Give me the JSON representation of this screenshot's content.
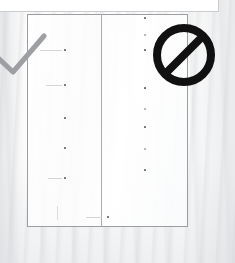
{
  "scene": {
    "title": "Garment inspection annotation",
    "background_color": "#fcfcfc",
    "fabric_texture": "vertical-streaks",
    "width": 235,
    "height": 263
  },
  "top_panel": {
    "name": "upper-white-panel",
    "fill_color": "#ffffff",
    "border_color": "#c9cbcd"
  },
  "document": {
    "name": "rectangular-placket-outline",
    "border_color": "#9b9da0",
    "fill_color": "#ffffff",
    "divider_color": "#a9abae",
    "left_panel_label": "left-panel",
    "right_panel_label": "right-panel"
  },
  "marks": {
    "left_column": [
      {
        "x": 65,
        "y": 50
      },
      {
        "x": 65,
        "y": 85
      },
      {
        "x": 65,
        "y": 118
      },
      {
        "x": 65,
        "y": 148
      },
      {
        "x": 65,
        "y": 178
      }
    ],
    "right_column": [
      {
        "x": 145,
        "y": 18
      },
      {
        "x": 145,
        "y": 50
      },
      {
        "x": 145,
        "y": 88
      },
      {
        "x": 145,
        "y": 127
      },
      {
        "x": 145,
        "y": 170
      }
    ],
    "bottom_mark": {
      "x": 108,
      "y": 217
    },
    "dot_color": "#6d6f72",
    "guide_color": "#d3d5d8"
  },
  "annotations": {
    "check": {
      "label": "checkmark",
      "meaning": "correct",
      "color": "#9d9fa2",
      "stroke_width": 5
    },
    "prohibition": {
      "label": "prohibition-sign",
      "meaning": "not allowed",
      "color": "#111111",
      "diameter": 62
    }
  }
}
